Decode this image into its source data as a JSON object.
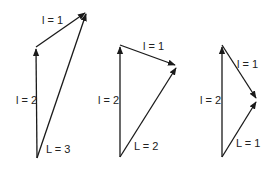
{
  "diagrams": [
    {
      "id": "d1",
      "labels": {
        "l2": "l = 2",
        "l1": "l = 1",
        "L": "L = 3"
      },
      "points": {
        "origin": [
          37,
          158
        ],
        "top": [
          36,
          47
        ],
        "tip": [
          87,
          12
        ]
      }
    },
    {
      "id": "d2",
      "labels": {
        "l2": "l = 2",
        "l1": "l = 1",
        "L": "L = 2"
      },
      "points": {
        "origin": [
          120,
          157
        ],
        "top": [
          120,
          45
        ],
        "tip": [
          177,
          66
        ]
      }
    },
    {
      "id": "d3",
      "labels": {
        "l2": "l = 2",
        "l1": "l = 1",
        "L": "L = 1"
      },
      "points": {
        "origin": [
          222,
          157
        ],
        "top": [
          222,
          45
        ],
        "tip": [
          257,
          100
        ]
      }
    }
  ],
  "colors": {
    "stroke": "#1a1a1a",
    "text": "#222222",
    "background": "#ffffff"
  }
}
